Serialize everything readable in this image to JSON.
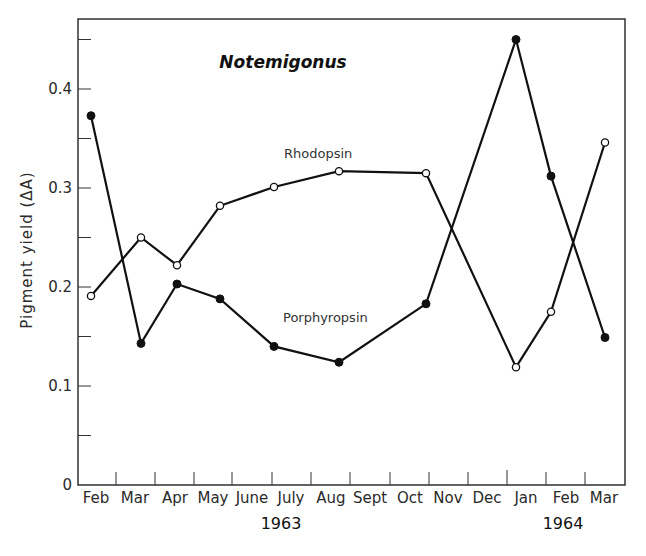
{
  "chart_data": {
    "type": "line",
    "title": "Notemigonus",
    "xlabel": "",
    "ylabel": "Pigment yield (ΔA)",
    "ylim": [
      0,
      0.47
    ],
    "yticks": [
      0,
      0.1,
      0.2,
      0.3,
      0.4
    ],
    "yticks_minor": [
      0.05,
      0.15,
      0.25,
      0.35,
      0.45
    ],
    "x_month_labels": [
      "Feb",
      "Mar",
      "Apr",
      "May",
      "June",
      "July",
      "Aug",
      "Sept",
      "Oct",
      "Nov",
      "Dec",
      "Jan",
      "Feb",
      "Mar"
    ],
    "x_year_labels": [
      {
        "label": "1963",
        "under_month_index": 5.5
      },
      {
        "label": "1964",
        "under_month_index": 12.3
      }
    ],
    "grid": false,
    "legend": "inline labels",
    "series": [
      {
        "name": "Rhodopsin",
        "marker": "open-circle",
        "x": [
          0.1,
          1.4,
          2.3,
          3.4,
          4.8,
          6.45,
          8.7,
          11.0,
          11.9,
          13.3
        ],
        "x_labels": [
          "Feb 1963",
          "Mar 1963",
          "Apr 1963",
          "May 1963",
          "July 1963",
          "Aug 1963",
          "Oct 1963",
          "Jan 1964",
          "Feb 1964",
          "Mar 1964"
        ],
        "values": [
          0.191,
          0.25,
          0.222,
          0.282,
          0.301,
          0.317,
          0.315,
          0.119,
          0.175,
          0.346
        ]
      },
      {
        "name": "Porphyropsin",
        "marker": "filled-circle",
        "x": [
          0.1,
          1.4,
          2.3,
          3.4,
          4.8,
          6.45,
          8.7,
          11.0,
          11.9,
          13.3
        ],
        "x_labels": [
          "Feb 1963",
          "Mar 1963",
          "Apr 1963",
          "May 1963",
          "July 1963",
          "Aug 1963",
          "Oct 1963",
          "Jan 1964",
          "Feb 1964",
          "Mar 1964"
        ],
        "values": [
          0.373,
          0.143,
          0.203,
          0.188,
          0.14,
          0.124,
          0.183,
          0.45,
          0.312,
          0.149
        ]
      }
    ],
    "annotations": [
      {
        "text": "Rhodopsin",
        "near_series": "Rhodopsin"
      },
      {
        "text": "Porphyropsin",
        "near_series": "Porphyropsin"
      }
    ]
  },
  "labels": {
    "title": "Notemigonus",
    "ylabel": "Pigment yield (ΔA)",
    "rhodopsin": "Rhodopsin",
    "porphyropsin": "Porphyropsin",
    "y0": "0",
    "y1": "0.1",
    "y2": "0.2",
    "y3": "0.3",
    "y4": "0.4",
    "year1": "1963",
    "year2": "1964"
  }
}
